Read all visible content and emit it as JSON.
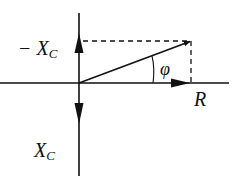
{
  "diagram": {
    "labels": {
      "neg_xc": "− X",
      "neg_xc_sub": "C",
      "xc": "X",
      "xc_sub": "C",
      "r": "R",
      "phi": "φ"
    },
    "colors": {
      "stroke": "#111111",
      "background": "#ffffff"
    }
  }
}
